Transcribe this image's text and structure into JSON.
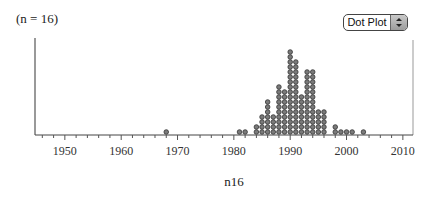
{
  "header": {
    "sample_size_label": "(n = 16)"
  },
  "controls": {
    "plot_type_select": {
      "selected": "Dot Plot",
      "icon": "up-down-arrows-icon"
    }
  },
  "chart_data": {
    "type": "scatter",
    "subtype": "dot_plot",
    "title": "",
    "xlabel": "n16",
    "ylabel": "",
    "xlim": [
      1944.7,
      2011.8
    ],
    "x_ticks": [
      1950,
      1960,
      1970,
      1980,
      1990,
      2000,
      2010
    ],
    "x_tick_labels": [
      "1950",
      "1960",
      "1970",
      "1980",
      "1990",
      "2000",
      "2010"
    ],
    "minor_tick_step": 2,
    "grid": false,
    "legend": null,
    "dot_color": "#7a7a7a",
    "dot_edge_color": "#333333",
    "bins": [
      {
        "x": 1968,
        "count": 1
      },
      {
        "x": 1981,
        "count": 1
      },
      {
        "x": 1982,
        "count": 1
      },
      {
        "x": 1984,
        "count": 2
      },
      {
        "x": 1985,
        "count": 4
      },
      {
        "x": 1986,
        "count": 7
      },
      {
        "x": 1987,
        "count": 4
      },
      {
        "x": 1988,
        "count": 10
      },
      {
        "x": 1989,
        "count": 9
      },
      {
        "x": 1990,
        "count": 17
      },
      {
        "x": 1991,
        "count": 15
      },
      {
        "x": 1992,
        "count": 8
      },
      {
        "x": 1993,
        "count": 13
      },
      {
        "x": 1994,
        "count": 13
      },
      {
        "x": 1995,
        "count": 5
      },
      {
        "x": 1996,
        "count": 5
      },
      {
        "x": 1998,
        "count": 2
      },
      {
        "x": 1999,
        "count": 1
      },
      {
        "x": 2000,
        "count": 1
      },
      {
        "x": 2001,
        "count": 1
      },
      {
        "x": 2003,
        "count": 1
      }
    ]
  }
}
